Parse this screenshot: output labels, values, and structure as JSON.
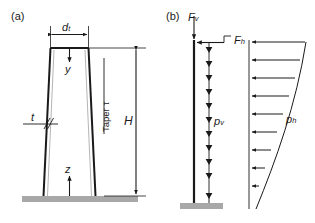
{
  "figure": {
    "panels": [
      {
        "tag": "(a)",
        "name": "tapered-tower-geometry",
        "labels": {
          "top_diameter": "d",
          "top_diameter_sub": "t",
          "height": "H",
          "wall_thickness": "t",
          "axis_down": "y",
          "axis_up": "z",
          "taper": "Taper τ"
        }
      },
      {
        "tag": "(b)",
        "name": "tower-loading-diagram",
        "labels": {
          "vertical_force": "F",
          "vertical_force_sub": "v",
          "horizontal_force": "F",
          "horizontal_force_sub": "h",
          "vertical_distributed_load": "p",
          "vertical_distributed_load_sub": "v",
          "horizontal_pressure": "p",
          "horizontal_pressure_sub": "h"
        }
      }
    ],
    "colors": {
      "line": "#1a1a1a",
      "ground": "#a8a8a8",
      "inner_wall": "#b5b5b5",
      "background": "#ffffff"
    },
    "counts": {
      "vertical_load_arrows": 11,
      "horizontal_pressure_arrows": 9
    }
  }
}
